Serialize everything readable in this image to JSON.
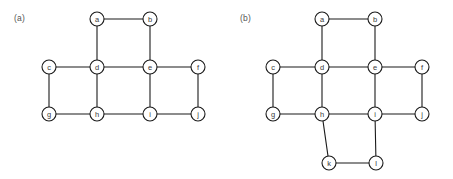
{
  "figure": {
    "background_color": "#ffffff",
    "edge_color": "#1a1a1a",
    "node_fill_color": "#ffffff",
    "node_stroke_color": "#1a1a1a",
    "label_color": "#3a3a3a",
    "caption_color": "#555555",
    "node_radius": 7
  },
  "panels": [
    {
      "id": "a",
      "caption": "(a)",
      "node_count": 10,
      "edge_count": 13,
      "nodes": [
        {
          "id": "a",
          "label": "a",
          "x": 97,
          "y": 19
        },
        {
          "id": "b",
          "label": "b",
          "x": 150,
          "y": 19
        },
        {
          "id": "c",
          "label": "c",
          "x": 49,
          "y": 67
        },
        {
          "id": "d",
          "label": "d",
          "x": 97,
          "y": 67
        },
        {
          "id": "e",
          "label": "e",
          "x": 150,
          "y": 67
        },
        {
          "id": "f",
          "label": "f",
          "x": 198,
          "y": 67
        },
        {
          "id": "g",
          "label": "g",
          "x": 49,
          "y": 114
        },
        {
          "id": "h",
          "label": "h",
          "x": 97,
          "y": 114
        },
        {
          "id": "i",
          "label": "i",
          "x": 150,
          "y": 114
        },
        {
          "id": "j",
          "label": "j",
          "x": 198,
          "y": 114
        }
      ],
      "edges": [
        [
          "a",
          "b"
        ],
        [
          "a",
          "d"
        ],
        [
          "b",
          "e"
        ],
        [
          "c",
          "d"
        ],
        [
          "c",
          "g"
        ],
        [
          "d",
          "e"
        ],
        [
          "d",
          "h"
        ],
        [
          "e",
          "f"
        ],
        [
          "e",
          "i"
        ],
        [
          "f",
          "j"
        ],
        [
          "g",
          "h"
        ],
        [
          "h",
          "i"
        ],
        [
          "i",
          "j"
        ]
      ]
    },
    {
      "id": "b",
      "caption": "(b)",
      "node_count": 12,
      "edge_count": 16,
      "nodes": [
        {
          "id": "a",
          "label": "a",
          "x": 96,
          "y": 19
        },
        {
          "id": "b",
          "label": "b",
          "x": 149,
          "y": 19
        },
        {
          "id": "c",
          "label": "c",
          "x": 47,
          "y": 67
        },
        {
          "id": "d",
          "label": "d",
          "x": 96,
          "y": 67
        },
        {
          "id": "e",
          "label": "e",
          "x": 149,
          "y": 67
        },
        {
          "id": "f",
          "label": "f",
          "x": 196,
          "y": 67
        },
        {
          "id": "g",
          "label": "g",
          "x": 47,
          "y": 114
        },
        {
          "id": "h",
          "label": "h",
          "x": 96,
          "y": 114
        },
        {
          "id": "i",
          "label": "i",
          "x": 149,
          "y": 114
        },
        {
          "id": "j",
          "label": "j",
          "x": 196,
          "y": 114
        },
        {
          "id": "k",
          "label": "k",
          "x": 103,
          "y": 163
        },
        {
          "id": "l",
          "label": "l",
          "x": 150,
          "y": 163
        }
      ],
      "edges": [
        [
          "a",
          "b"
        ],
        [
          "a",
          "d"
        ],
        [
          "b",
          "e"
        ],
        [
          "c",
          "d"
        ],
        [
          "c",
          "g"
        ],
        [
          "d",
          "e"
        ],
        [
          "d",
          "h"
        ],
        [
          "e",
          "f"
        ],
        [
          "e",
          "i"
        ],
        [
          "f",
          "j"
        ],
        [
          "g",
          "h"
        ],
        [
          "h",
          "i"
        ],
        [
          "i",
          "j"
        ],
        [
          "h",
          "k"
        ],
        [
          "k",
          "l"
        ],
        [
          "l",
          "i"
        ]
      ]
    }
  ]
}
